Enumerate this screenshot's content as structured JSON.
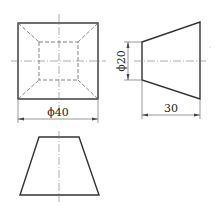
{
  "drawing": {
    "views": [
      "front-view",
      "side-view",
      "top-view"
    ],
    "dimensions": {
      "front_width": "ϕ40",
      "side_height": "ϕ20",
      "side_length": "30"
    }
  }
}
